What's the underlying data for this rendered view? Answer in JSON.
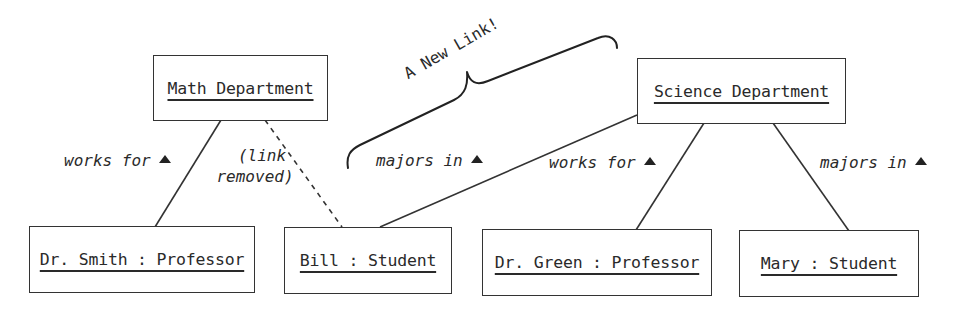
{
  "diagram": {
    "type": "uml-object-diagram",
    "objects": [
      {
        "id": "math",
        "label": "Math Department"
      },
      {
        "id": "science",
        "label": "Science Department"
      },
      {
        "id": "smith",
        "label": "Dr. Smith : Professor"
      },
      {
        "id": "bill",
        "label": "Bill : Student"
      },
      {
        "id": "green",
        "label": "Dr. Green : Professor"
      },
      {
        "id": "mary",
        "label": "Mary : Student"
      }
    ],
    "links": [
      {
        "from": "smith",
        "to": "math",
        "label": "works for",
        "style": "solid",
        "direction_marker": "▲"
      },
      {
        "from": "bill",
        "to": "math",
        "label": "(link removed)",
        "style": "dashed"
      },
      {
        "from": "bill",
        "to": "science",
        "label": "majors in",
        "style": "solid",
        "direction_marker": "▲"
      },
      {
        "from": "green",
        "to": "science",
        "label": "works for",
        "style": "solid",
        "direction_marker": "▲"
      },
      {
        "from": "mary",
        "to": "science",
        "label": "majors in",
        "style": "solid",
        "direction_marker": "▲"
      }
    ],
    "removed_note": {
      "line1": "(link",
      "line2": "removed)"
    },
    "annotation": {
      "text": "A New Link!",
      "shape": "curly-brace"
    },
    "colors": {
      "stroke": "#333333",
      "text": "#2a2a2a",
      "background": "#ffffff"
    }
  }
}
